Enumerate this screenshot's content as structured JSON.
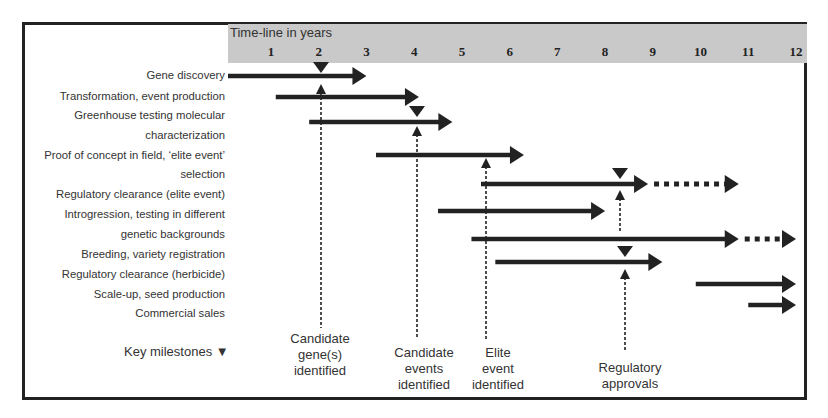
{
  "chart_data": {
    "type": "gantt",
    "title": "Time-line in years",
    "x_ticks": [
      "1",
      "2",
      "3",
      "4",
      "5",
      "6",
      "7",
      "8",
      "9",
      "10",
      "11",
      "12"
    ],
    "x_range_years": [
      0.5,
      12
    ],
    "tasks": [
      {
        "label": "Gene discovery",
        "start": 0.5,
        "end": 3.0
      },
      {
        "label": "Transformation, event production",
        "start": 1.1,
        "end": 4.1
      },
      {
        "label": "Greenhouse testing molecular characterization",
        "start": 1.8,
        "end": 4.8
      },
      {
        "label": "Proof of concept in field, 'elite event' selection",
        "start": 3.2,
        "end": 6.3
      },
      {
        "label": "Regulatory clearance (elite event)",
        "start": 5.4,
        "end": 8.9,
        "dotted_end": 10.8
      },
      {
        "label": "Introgression, testing in different genetic backgrounds",
        "start": 4.5,
        "end": 8.0
      },
      {
        "label": "Breeding, variety registration",
        "start": 5.2,
        "end": 10.8,
        "dotted_end": 12.0
      },
      {
        "label": "Regulatory clearance (herbicide)",
        "start": 5.7,
        "end": 9.2
      },
      {
        "label": "Scale-up, seed production",
        "start": 9.9,
        "end": 12.0
      },
      {
        "label": "Commercial sales",
        "start": 11.0,
        "end": 12.0
      }
    ],
    "milestones": [
      {
        "label": "Candidate gene(s) identified",
        "year": 2.1
      },
      {
        "label": "Candidate events identified",
        "year": 4.1
      },
      {
        "label": "Elite event identified",
        "year": 5.6
      },
      {
        "label": "Regulatory approvals",
        "year": 8.7
      },
      {
        "label": "Regulatory approvals",
        "year": 8.8
      }
    ],
    "legend": "Key milestones"
  },
  "labels": {
    "header": "Time-line in years",
    "rows": [
      "Gene discovery",
      "Transformation, event production",
      "Greenhouse testing molecular",
      "characterization",
      "Proof of concept in field, ‘elite event’",
      "selection",
      "Regulatory clearance (elite event)",
      "Introgression, testing in different",
      "genetic backgrounds",
      "Breeding, variety registration",
      "Regulatory clearance (herbicide)",
      "Scale-up, seed production",
      "Commercial sales"
    ],
    "key": "Key milestones",
    "milestone_labels": [
      [
        "Candidate",
        "gene(s)",
        "identified"
      ],
      [
        "Candidate",
        "events",
        "identified"
      ],
      [
        "Elite",
        "event",
        "identified"
      ],
      [
        "Regulatory",
        "approvals"
      ]
    ]
  },
  "colors": {
    "header_bg": "#c9c9c9",
    "arrow": "#222222",
    "border": "#222222"
  }
}
